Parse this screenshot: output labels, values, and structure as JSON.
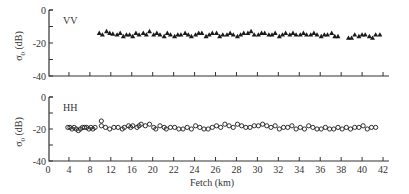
{
  "chart_data": [
    {
      "type": "scatter",
      "panel": "top",
      "title": "",
      "label": "VV",
      "marker": "filled-triangle",
      "xlabel": "",
      "ylabel": "σ0 (dB)",
      "ylim": [
        -40,
        0
      ],
      "yticks": [
        0,
        -20,
        -40
      ],
      "yminor": [
        -10,
        -30
      ],
      "x_tick_labels": [
        "0",
        "4",
        "8",
        "12",
        "16",
        "20",
        "22",
        "24",
        "26",
        "28",
        "30",
        "32",
        "34",
        "36",
        "38",
        "40",
        "42"
      ],
      "series": [
        {
          "name": "VV",
          "x_tick_pos": [
            2.4,
            2.55,
            2.75,
            2.9,
            3.05,
            3.25,
            3.4,
            3.55,
            3.7,
            3.85,
            4.0,
            4.15,
            4.3,
            4.5,
            4.65,
            4.8,
            5.0,
            5.15,
            5.3,
            5.5,
            5.65,
            5.8,
            6.0,
            6.15,
            6.3,
            6.5,
            6.65,
            6.8,
            7.0,
            7.15,
            7.3,
            7.5,
            7.65,
            7.8,
            8.0,
            8.15,
            8.3,
            8.5,
            8.65,
            8.8,
            9.0,
            9.15,
            9.3,
            9.5,
            9.65,
            9.8,
            10.0,
            10.15,
            10.3,
            10.5,
            10.65,
            10.8,
            11.0,
            11.15,
            11.3,
            11.5,
            11.65,
            11.8,
            12.0,
            12.15,
            12.3,
            12.5,
            12.65,
            12.8,
            13.0,
            13.15,
            13.3,
            13.5,
            13.65,
            13.8,
            14.3,
            14.45,
            14.6,
            14.8,
            14.95,
            15.1,
            15.3,
            15.45,
            15.6,
            15.8
          ],
          "values": [
            -14,
            -15,
            -13,
            -14,
            -14.5,
            -15,
            -14,
            -16,
            -15,
            -15,
            -16,
            -14,
            -15,
            -14,
            -15,
            -13,
            -15,
            -14,
            -15,
            -16,
            -14,
            -15,
            -16,
            -15,
            -15,
            -14,
            -15,
            -16,
            -15,
            -14,
            -14,
            -16,
            -15,
            -14,
            -14,
            -16,
            -15,
            -15,
            -14,
            -15,
            -16,
            -15,
            -14,
            -14,
            -13,
            -15,
            -15,
            -14,
            -14,
            -15,
            -15,
            -14,
            -16,
            -15,
            -14,
            -15,
            -14,
            -15,
            -15,
            -14,
            -15,
            -15,
            -14,
            -15,
            -16,
            -15,
            -15,
            -14,
            -16,
            -16,
            -17,
            -17,
            -15,
            -16,
            -15,
            -15,
            -16,
            -17,
            -15,
            -15
          ]
        }
      ]
    },
    {
      "type": "scatter",
      "panel": "bottom",
      "title": "",
      "label": "HH",
      "marker": "open-circle",
      "xlabel": "Fetch (km)",
      "ylabel": "σ0 (dB)",
      "ylim": [
        -40,
        0
      ],
      "yticks": [
        0,
        -20,
        -40
      ],
      "yminor": [
        -10,
        -30
      ],
      "x_tick_labels": [
        "0",
        "4",
        "8",
        "12",
        "16",
        "20",
        "22",
        "24",
        "26",
        "28",
        "30",
        "32",
        "34",
        "36",
        "38",
        "40",
        "42"
      ],
      "series": [
        {
          "name": "HH",
          "x_tick_pos": [
            0.9,
            1.0,
            1.1,
            1.2,
            1.3,
            1.4,
            1.5,
            1.6,
            1.7,
            1.8,
            1.9,
            2.0,
            2.1,
            2.2,
            2.5,
            2.5,
            2.7,
            2.9,
            3.1,
            3.3,
            3.5,
            3.6,
            3.8,
            3.9,
            4.0,
            4.2,
            4.3,
            4.4,
            4.6,
            4.8,
            5.0,
            5.1,
            5.3,
            5.5,
            5.6,
            5.8,
            6.0,
            6.2,
            6.4,
            6.6,
            6.8,
            7.0,
            7.2,
            7.4,
            7.6,
            7.8,
            8.0,
            8.2,
            8.4,
            8.6,
            8.8,
            9.0,
            9.2,
            9.4,
            9.6,
            9.8,
            10.0,
            10.2,
            10.4,
            10.6,
            10.8,
            11.0,
            11.2,
            11.4,
            11.6,
            11.8,
            12.0,
            12.2,
            12.4,
            12.6,
            12.8,
            13.0,
            13.2,
            13.4,
            13.6,
            13.8,
            14.0,
            14.2,
            14.4,
            14.6,
            14.8,
            15.0,
            15.2,
            15.4,
            15.6
          ],
          "values": [
            -19,
            -19,
            -20,
            -19,
            -20,
            -21,
            -20,
            -19,
            -19,
            -19,
            -20,
            -19,
            -20,
            -19,
            -15,
            -18,
            -19,
            -20,
            -19,
            -19,
            -20,
            -19,
            -18,
            -19,
            -18,
            -19,
            -18,
            -17,
            -18,
            -17,
            -19,
            -20,
            -18,
            -19,
            -20,
            -19,
            -19,
            -20,
            -20,
            -19,
            -20,
            -18,
            -19,
            -20,
            -20,
            -19,
            -18,
            -19,
            -17,
            -18,
            -19,
            -17,
            -18,
            -19,
            -19,
            -18,
            -18,
            -17,
            -18,
            -19,
            -18,
            -20,
            -19,
            -19,
            -18,
            -20,
            -19,
            -20,
            -18,
            -19,
            -20,
            -20,
            -19,
            -20,
            -20,
            -19,
            -20,
            -19,
            -20,
            -19,
            -19,
            -18,
            -20,
            -19,
            -19
          ]
        }
      ]
    }
  ],
  "labels": {
    "vv": "VV",
    "hh": "HH",
    "ylabel_main": "σ",
    "ylabel_sub": "0",
    "ylabel_unit": " (dB)",
    "xlabel": "Fetch (km)"
  }
}
